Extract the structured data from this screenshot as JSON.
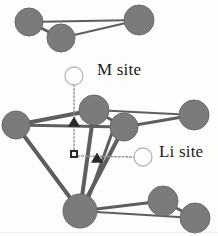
{
  "figure": {
    "background_color": "#fdfdfc",
    "atom_color": "#7b7b7b",
    "atom_stroke_color": "#6a6a6a",
    "bond_color": "#5e5e5e",
    "marker_color": "#2a2a2a",
    "open_circle_stroke": "#b5b5b5",
    "dotted_line_color": "#9a9a9a"
  },
  "labels": {
    "m_site": "M site",
    "li_site": "Li site"
  },
  "atoms": [
    {
      "name": "atom-top-left",
      "cx": 29,
      "cy": 22,
      "r": 14
    },
    {
      "name": "atom-top-middle",
      "cx": 61,
      "cy": 38,
      "r": 14
    },
    {
      "name": "atom-top-right",
      "cx": 139,
      "cy": 20,
      "r": 15
    },
    {
      "name": "atom-mid-left",
      "cx": 16,
      "cy": 125,
      "r": 14
    },
    {
      "name": "atom-center-upper",
      "cx": 94,
      "cy": 110,
      "r": 15
    },
    {
      "name": "atom-center-lower",
      "cx": 124,
      "cy": 127,
      "r": 14
    },
    {
      "name": "atom-mid-right",
      "cx": 194,
      "cy": 115,
      "r": 15
    },
    {
      "name": "atom-bottom-left",
      "cx": 80,
      "cy": 211,
      "r": 17
    },
    {
      "name": "atom-bottom-mid",
      "cx": 163,
      "cy": 201,
      "r": 15
    },
    {
      "name": "atom-bottom-right",
      "cx": 195,
      "cy": 218,
      "r": 15
    }
  ],
  "bonds": [
    {
      "name": "bond-topleft-topmiddle",
      "x1": 29,
      "y1": 22,
      "x2": 61,
      "y2": 38,
      "w": 3
    },
    {
      "name": "bond-topleft-topright",
      "x1": 29,
      "y1": 22,
      "x2": 139,
      "y2": 20,
      "w": 2
    },
    {
      "name": "bond-topmiddle-topright",
      "x1": 61,
      "y1": 38,
      "x2": 139,
      "y2": 20,
      "w": 2
    },
    {
      "name": "bond-midleft-centerupper",
      "x1": 16,
      "y1": 125,
      "x2": 94,
      "y2": 110,
      "w": 4
    },
    {
      "name": "bond-midleft-centerlower",
      "x1": 16,
      "y1": 125,
      "x2": 124,
      "y2": 127,
      "w": 3
    },
    {
      "name": "bond-midleft-bottomleft",
      "x1": 16,
      "y1": 125,
      "x2": 80,
      "y2": 211,
      "w": 4
    },
    {
      "name": "bond-centerupper-centerlower",
      "x1": 94,
      "y1": 110,
      "x2": 124,
      "y2": 127,
      "w": 3
    },
    {
      "name": "bond-centerupper-midright",
      "x1": 94,
      "y1": 110,
      "x2": 194,
      "y2": 115,
      "w": 2
    },
    {
      "name": "bond-centerlower-midright",
      "x1": 124,
      "y1": 127,
      "x2": 194,
      "y2": 115,
      "w": 3
    },
    {
      "name": "bond-centerupper-bottomleft",
      "x1": 94,
      "y1": 110,
      "x2": 80,
      "y2": 211,
      "w": 4
    },
    {
      "name": "bond-centerlower-bottomleft",
      "x1": 124,
      "y1": 127,
      "x2": 80,
      "y2": 211,
      "w": 4
    },
    {
      "name": "bond-centerlower-bottomleft2",
      "x1": 112,
      "y1": 133,
      "x2": 84,
      "y2": 211,
      "w": 3
    },
    {
      "name": "bond-bottomleft-bottommid",
      "x1": 80,
      "y1": 211,
      "x2": 163,
      "y2": 201,
      "w": 3
    },
    {
      "name": "bond-bottomleft-bottomright",
      "x1": 80,
      "y1": 211,
      "x2": 195,
      "y2": 218,
      "w": 2
    },
    {
      "name": "bond-bottommid-bottomright",
      "x1": 163,
      "y1": 201,
      "x2": 195,
      "y2": 218,
      "w": 3
    }
  ],
  "site_markers": {
    "m_site_circle": {
      "cx": 74,
      "cy": 76,
      "r": 9
    },
    "li_site_circle": {
      "cx": 143,
      "cy": 157,
      "r": 9
    },
    "triangle_upper": {
      "cx": 74,
      "cy": 122,
      "size": 6
    },
    "triangle_lower": {
      "cx": 97,
      "cy": 158,
      "size": 6
    },
    "square_marker": {
      "cx": 74,
      "cy": 154,
      "size": 6
    }
  },
  "guide_lines": [
    {
      "name": "dotted-vertical-m-site",
      "x1": 74,
      "y1": 85,
      "x2": 74,
      "y2": 153
    },
    {
      "name": "dotted-horizontal-li-site",
      "x1": 78,
      "y1": 156,
      "x2": 134,
      "y2": 157
    }
  ]
}
